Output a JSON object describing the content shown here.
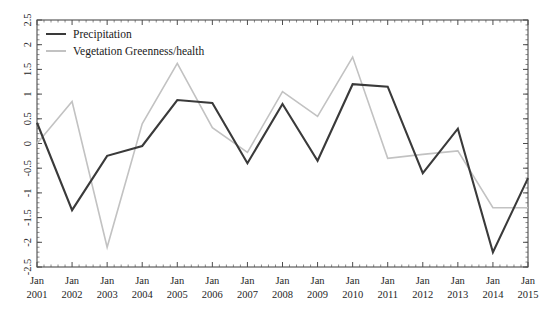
{
  "chart_data": {
    "type": "line",
    "title": "",
    "xlabel": "",
    "ylabel": "",
    "grid": false,
    "legend_position": "top-left",
    "ylim": [
      -2.5,
      2.5
    ],
    "ytick_labels": [
      "2.5",
      "2",
      "1.5",
      "1",
      "0.5",
      "0",
      "-0.5",
      "-1",
      "-1.5",
      "-2",
      "-2.5"
    ],
    "ytick_values": [
      2.5,
      2,
      1.5,
      1,
      0.5,
      0,
      -0.5,
      -1,
      -1.5,
      -2,
      -2.5
    ],
    "y_minor_step": 0.1,
    "x_month_label": "Jan",
    "categories": [
      "Jan 2001",
      "Jan 2002",
      "Jan 2003",
      "Jan 2004",
      "Jan 2005",
      "Jan 2006",
      "Jan 2007",
      "Jan 2008",
      "Jan 2009",
      "Jan 2010",
      "Jan 2011",
      "Jan 2012",
      "Jan 2013",
      "Jan 2014",
      "Jan 2015"
    ],
    "xtick_years": [
      "2001",
      "2002",
      "2003",
      "2004",
      "2005",
      "2006",
      "2007",
      "2008",
      "2009",
      "2010",
      "2011",
      "2012",
      "2013",
      "2014",
      "2015"
    ],
    "x_minor_per_major": 5,
    "series": [
      {
        "name": "Precipitation",
        "color": "#3a3a3a",
        "width": 2.1,
        "values": [
          0.42,
          -1.35,
          -0.25,
          -0.05,
          0.88,
          0.82,
          -0.4,
          0.8,
          -0.35,
          1.2,
          1.15,
          -0.6,
          0.3,
          -2.2,
          -0.7
        ]
      },
      {
        "name": "Vegetation Greenness/health",
        "color": "#c2c2c2",
        "width": 1.6,
        "values": [
          0.0,
          0.85,
          -2.1,
          0.4,
          1.62,
          0.32,
          -0.18,
          1.05,
          0.55,
          1.75,
          -0.3,
          -0.22,
          -0.15,
          -1.3,
          -1.3
        ]
      }
    ]
  },
  "legend": {
    "items": [
      {
        "label": "Precipitation"
      },
      {
        "label": "Vegetation Greenness/health"
      }
    ]
  }
}
